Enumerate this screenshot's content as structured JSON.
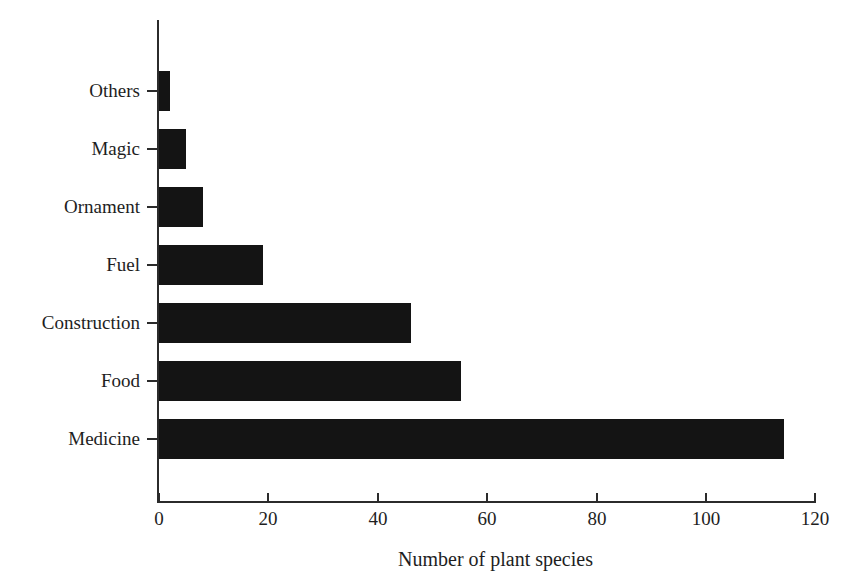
{
  "chart_data": {
    "type": "bar",
    "orientation": "horizontal",
    "title": "",
    "subtitle": "",
    "xlabel": "Number of plant species",
    "ylabel": "",
    "categories": [
      "Medicine",
      "Food",
      "Construction",
      "Fuel",
      "Ornament",
      "Magic",
      "Others"
    ],
    "values": [
      114,
      55,
      46,
      19,
      8,
      5,
      2
    ],
    "series": [
      {
        "name": "Number of plant species",
        "values": [
          114,
          55,
          46,
          19,
          8,
          5,
          2
        ]
      }
    ],
    "xlim": [
      0,
      120
    ],
    "ylim": null,
    "xticks": [
      0,
      20,
      40,
      60,
      80,
      100,
      120
    ],
    "xtick_labels": [
      "0",
      "20",
      "40",
      "60",
      "80",
      "100",
      "120"
    ],
    "ytick_labels": [
      "Others",
      "Magic",
      "Ornament",
      "Fuel",
      "Construction",
      "Food",
      "Medicine"
    ],
    "grid": false,
    "legend": false,
    "legend_position": "none",
    "bar_color": "#141414",
    "axis_color": "#2b2b2b",
    "background_color": "#ffffff",
    "annotations": []
  },
  "bars": [
    {
      "label": "Others",
      "value": 2,
      "top": 62,
      "width_px": 11
    },
    {
      "label": "Magic",
      "value": 5,
      "top": 120,
      "width_px": 27
    },
    {
      "label": "Ornament",
      "value": 8,
      "top": 178,
      "width_px": 44
    },
    {
      "label": "Fuel",
      "value": 19,
      "top": 236,
      "width_px": 104
    },
    {
      "label": "Construction",
      "value": 46,
      "top": 294,
      "width_px": 252
    },
    {
      "label": "Food",
      "value": 55,
      "top": 352,
      "width_px": 302
    },
    {
      "label": "Medicine",
      "value": 114,
      "top": 410,
      "width_px": 625
    }
  ],
  "xaxis": {
    "title": "Number of plant species",
    "ticks": [
      {
        "label": "0",
        "value": 0,
        "left": 158
      },
      {
        "label": "20",
        "value": 20,
        "left": 267
      },
      {
        "label": "40",
        "value": 40,
        "left": 377
      },
      {
        "label": "60",
        "value": 60,
        "left": 486
      },
      {
        "label": "80",
        "value": 80,
        "left": 596
      },
      {
        "label": "100",
        "value": 100,
        "left": 705
      },
      {
        "label": "120",
        "value": 120,
        "left": 814
      }
    ]
  }
}
